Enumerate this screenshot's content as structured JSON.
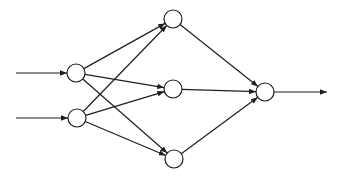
{
  "diagram": {
    "type": "feedforward-neural-network",
    "canvas": {
      "width": 344,
      "height": 179,
      "background": "#ffffff"
    },
    "style": {
      "stroke_color": "#1e1e1e",
      "node_fill": "#ffffff",
      "stroke_width": 1.2,
      "node_radius": 9,
      "arrowhead_length": 7,
      "arrowhead_width": 5.5
    },
    "layers": [
      {
        "name": "input",
        "node_count": 2
      },
      {
        "name": "hidden",
        "node_count": 3
      },
      {
        "name": "output",
        "node_count": 1
      }
    ],
    "nodes": [
      {
        "id": "input-1",
        "layer": "input",
        "cx": 76,
        "cy": 73
      },
      {
        "id": "input-2",
        "layer": "input",
        "cx": 77,
        "cy": 118
      },
      {
        "id": "hidden-1",
        "layer": "hidden",
        "cx": 173,
        "cy": 19
      },
      {
        "id": "hidden-2",
        "layer": "hidden",
        "cx": 173,
        "cy": 89
      },
      {
        "id": "hidden-3",
        "layer": "hidden",
        "cx": 174,
        "cy": 159
      },
      {
        "id": "output-1",
        "layer": "output",
        "cx": 265,
        "cy": 92
      }
    ],
    "edges": [
      {
        "id": "external-to-input-1",
        "from": {
          "x": 16,
          "y": 73
        },
        "to": "input-1"
      },
      {
        "id": "external-to-input-2",
        "from": {
          "x": 16,
          "y": 118
        },
        "to": "input-2"
      },
      {
        "id": "input-1-to-hidden-1",
        "from": "input-1",
        "to": "hidden-1"
      },
      {
        "id": "input-1-to-hidden-2",
        "from": "input-1",
        "to": "hidden-2"
      },
      {
        "id": "input-1-to-hidden-3",
        "from": "input-1",
        "to": "hidden-3"
      },
      {
        "id": "input-2-to-hidden-1",
        "from": "input-2",
        "to": "hidden-1"
      },
      {
        "id": "input-2-to-hidden-2",
        "from": "input-2",
        "to": "hidden-2"
      },
      {
        "id": "input-2-to-hidden-3",
        "from": "input-2",
        "to": "hidden-3"
      },
      {
        "id": "hidden-1-to-output-1",
        "from": "hidden-1",
        "to": "output-1"
      },
      {
        "id": "hidden-2-to-output-1",
        "from": "hidden-2",
        "to": "output-1"
      },
      {
        "id": "hidden-3-to-output-1",
        "from": "hidden-3",
        "to": "output-1"
      },
      {
        "id": "output-1-to-external",
        "from": "output-1",
        "to": {
          "x": 327,
          "y": 92
        }
      }
    ]
  }
}
